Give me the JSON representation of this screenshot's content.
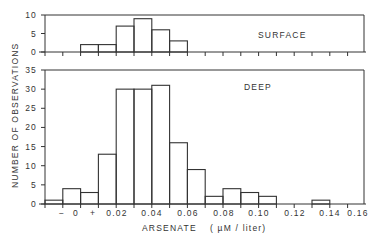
{
  "chart_data": [
    {
      "type": "bar",
      "panel_label": "SURFACE",
      "categories": [
        "-",
        "0",
        "+",
        "0.00-0.01",
        "0.01-0.02",
        "0.02-0.03",
        "0.03-0.04",
        "0.04-0.05",
        "0.05-0.06",
        "0.06-0.07",
        "0.07-0.08",
        "0.08-0.09",
        "0.09-0.10",
        "0.10-0.11",
        "0.11-0.12",
        "0.12-0.13",
        "0.13-0.14",
        "0.14-0.15",
        "0.15-0.16"
      ],
      "bins": [
        0,
        0,
        2,
        2,
        7,
        9,
        6,
        3,
        0,
        0,
        0,
        0,
        0,
        0,
        0,
        0
      ],
      "values": [
        0,
        0,
        2,
        2,
        7,
        9,
        6,
        3,
        0,
        0,
        0,
        0,
        0,
        0,
        0,
        0
      ],
      "ylim": [
        0,
        10
      ],
      "yticks": [
        "0",
        "5",
        "10"
      ]
    },
    {
      "type": "bar",
      "panel_label": "DEEP",
      "values": [
        1,
        4,
        3,
        13,
        30,
        30,
        31,
        16,
        9,
        2,
        4,
        3,
        2,
        0,
        0,
        1
      ],
      "ylim": [
        0,
        35
      ],
      "yticks": [
        "0",
        "5",
        "10",
        "15",
        "20",
        "25",
        "30",
        "35"
      ]
    }
  ],
  "axes": {
    "xlabel": "ARSENATE",
    "xunit": "( µM / liter)",
    "ylabel": "NUMBER OF OBSERVATIONS",
    "xticks": [
      "−",
      "0",
      "+",
      "0.02",
      "0.04",
      "0.06",
      "0.08",
      "0.10",
      "0.12",
      "0.14",
      "0.16"
    ]
  }
}
